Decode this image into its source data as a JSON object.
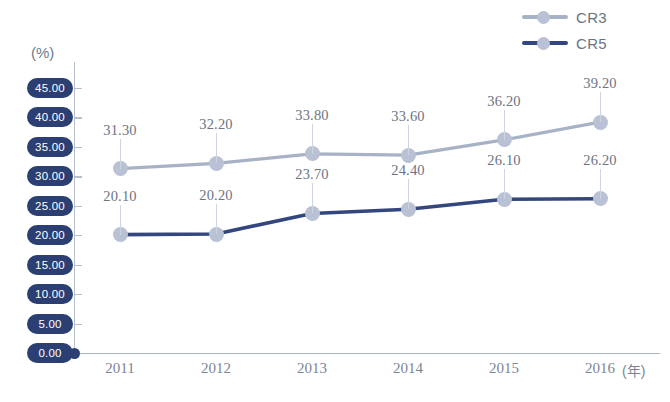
{
  "chart_data": {
    "type": "line",
    "title": "",
    "xlabel": "(年)",
    "ylabel": "(%)",
    "categories": [
      "2011",
      "2012",
      "2013",
      "2014",
      "2015",
      "2016"
    ],
    "ylim": [
      0,
      45
    ],
    "ytick_labels": [
      "45.00",
      "40.00",
      "35.00",
      "30.00",
      "25.00",
      "20.00",
      "15.00",
      "10.00",
      "5.00",
      "0.00"
    ],
    "ytick_values": [
      45,
      40,
      35,
      30,
      25,
      20,
      15,
      10,
      5,
      0
    ],
    "grid": false,
    "legend_position": "top-right",
    "series": [
      {
        "name": "CR3",
        "color": "#a8b2c6",
        "values": [
          31.3,
          32.2,
          33.8,
          33.6,
          36.2,
          39.2
        ],
        "labels": [
          "31.30",
          "32.20",
          "33.80",
          "33.60",
          "36.20",
          "39.20"
        ]
      },
      {
        "name": "CR5",
        "color": "#33477e",
        "values": [
          20.1,
          20.2,
          23.7,
          24.4,
          26.1,
          26.2
        ],
        "labels": [
          "20.10",
          "20.20",
          "23.70",
          "24.40",
          "26.10",
          "26.20"
        ]
      }
    ]
  },
  "legend": {
    "items": [
      {
        "label": "CR3",
        "line_color": "#a8b2c6",
        "marker_color": "#b9c2d4"
      },
      {
        "label": "CR5",
        "line_color": "#33477e",
        "marker_color": "#b9c2d4"
      }
    ]
  },
  "axes": {
    "y_unit": "(%)",
    "x_unit": "(年)",
    "axis_color": "#b8bfcc",
    "pill_color": "#2c3f73",
    "pill_text_color": "#ffffff"
  }
}
